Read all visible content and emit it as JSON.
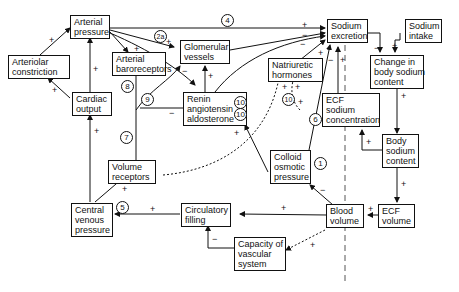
{
  "nodes": {
    "arterial_pressure": [
      "Arterial",
      "pressure"
    ],
    "arteriolar_constriction": [
      "Arteriolar",
      "constriction"
    ],
    "arterial_baroreceptors": [
      "Arterial",
      "baroreceptors"
    ],
    "glomerular_vessels": [
      "Glomerular",
      "vessels"
    ],
    "sodium_excretion": [
      "Sodium",
      "excretion"
    ],
    "sodium_intake": [
      "Sodium",
      "intake"
    ],
    "change_body_sodium": [
      "Change in",
      "body sodium",
      "content"
    ],
    "natriuretic_hormones": [
      "Natriuretic",
      "hormones"
    ],
    "cardiac_output": [
      "Cardiac",
      "output"
    ],
    "renin": [
      "Renin",
      "angiotensin",
      "aldosterone"
    ],
    "ecf_sodium_conc": [
      "ECF",
      "sodium",
      "concentration"
    ],
    "body_sodium_content": [
      "Body",
      "sodium",
      "content"
    ],
    "volume_receptors": [
      "Volume",
      "receptors"
    ],
    "colloid_osmotic": [
      "Colloid",
      "osmotic",
      "pressure"
    ],
    "central_venous": [
      "Central",
      "venous",
      "pressure"
    ],
    "circulatory_filling": [
      "Circulatory",
      "filling"
    ],
    "blood_volume": [
      "Blood",
      "volume"
    ],
    "ecf_volume": [
      "ECF",
      "volume"
    ],
    "capacity_vascular": [
      "Capacity of",
      "vascular",
      "system"
    ]
  },
  "markers": [
    "1",
    "2",
    "2a",
    "3",
    "4",
    "5",
    "6",
    "7",
    "8",
    "9",
    "10"
  ],
  "signs": {
    "plus": "+",
    "minus": "−"
  }
}
